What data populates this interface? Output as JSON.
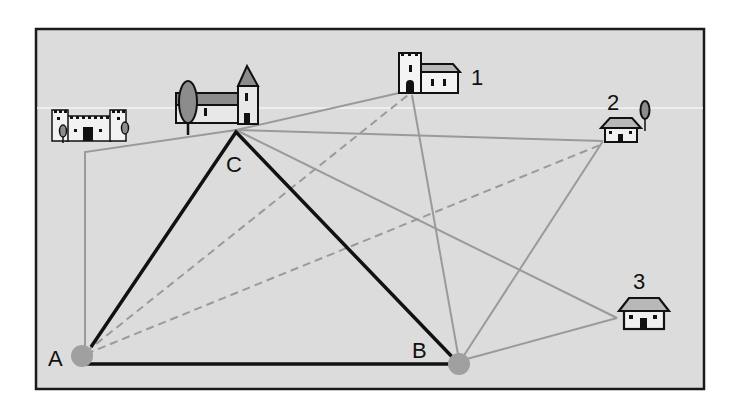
{
  "figure": {
    "type": "geometry-triangulation-diagram",
    "background_color": "#dcdcdc",
    "frame_color": "#1a1a1a",
    "triangle_color": "#111111",
    "sight_line_color": "#999999",
    "point_color": "#a0a0a0"
  },
  "vertices": {
    "A": {
      "label": "A",
      "x": 82,
      "y": 356
    },
    "B": {
      "label": "B",
      "x": 459,
      "y": 364
    },
    "C": {
      "label": "C",
      "x": 236,
      "y": 130
    }
  },
  "landmarks": [
    {
      "id": "castle",
      "label": "",
      "icon": "castle-icon"
    },
    {
      "id": "church",
      "label": "",
      "icon": "church-icon"
    },
    {
      "id": "1",
      "label": "1",
      "icon": "tower-house-icon"
    },
    {
      "id": "2",
      "label": "2",
      "icon": "house-with-tree-icon"
    },
    {
      "id": "3",
      "label": "3",
      "icon": "house-icon"
    }
  ],
  "lines": {
    "triangle": [
      "A-B",
      "B-C",
      "C-A"
    ],
    "solid_sight_lines": [
      "C-castle",
      "castle-A",
      "C-1",
      "C-2",
      "C-3",
      "B-1",
      "B-2",
      "B-3"
    ],
    "dashed_sight_lines": [
      "A-1",
      "A-2"
    ]
  }
}
